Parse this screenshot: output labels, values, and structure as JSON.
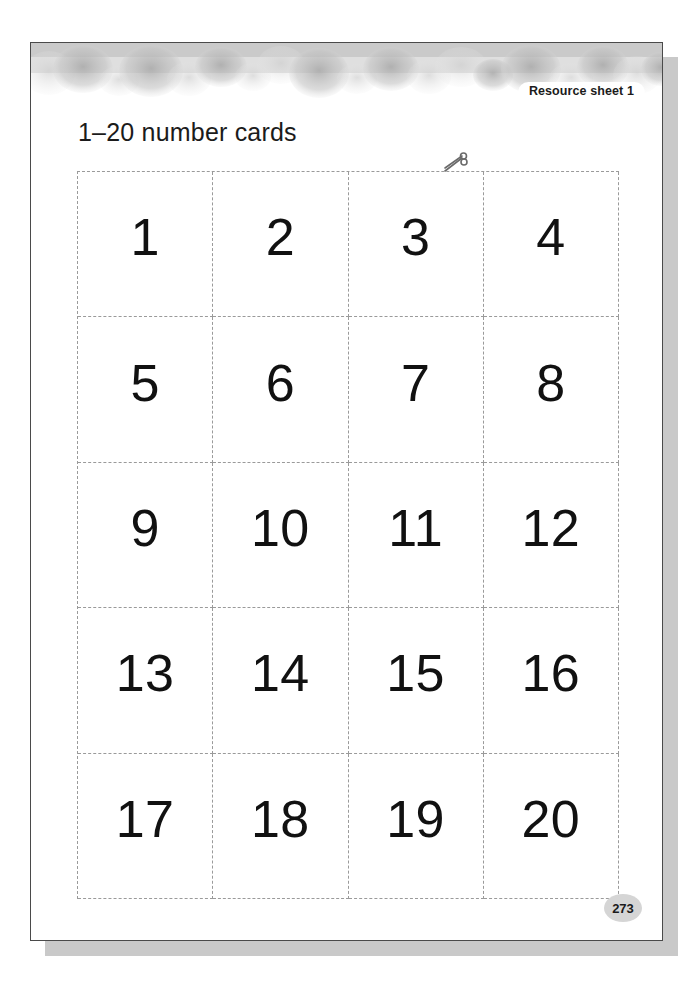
{
  "page": {
    "resource_badge": "Resource sheet 1",
    "title": "1–20 number cards",
    "page_number": "273",
    "scissors_icon_name": "scissors-icon",
    "colors": {
      "page_background": "#ffffff",
      "page_border": "#4a4a4a",
      "shadow": "#c9c9c9",
      "cut_line": "#9a9a9a",
      "number_text": "#111111",
      "decor_band": "#bcbcbc",
      "page_number_badge": "#d5d5d5"
    }
  },
  "cards": {
    "columns": 4,
    "rows": 5,
    "values": [
      "1",
      "2",
      "3",
      "4",
      "5",
      "6",
      "7",
      "8",
      "9",
      "10",
      "11",
      "12",
      "13",
      "14",
      "15",
      "16",
      "17",
      "18",
      "19",
      "20"
    ]
  }
}
